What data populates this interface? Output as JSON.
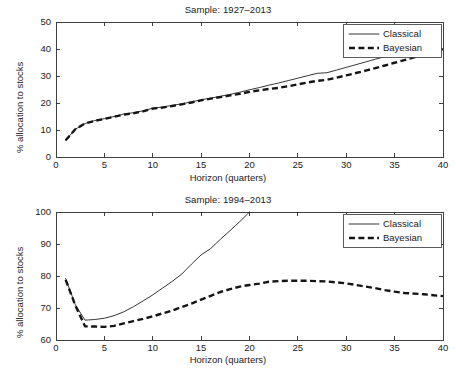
{
  "figure": {
    "width": 456,
    "height": 380,
    "background": "#ffffff",
    "line_color": "#1f1f1f"
  },
  "chart_data": [
    {
      "type": "line",
      "title": "Sample: 1927–2013",
      "xlabel": "Horizon (quarters)",
      "ylabel": "% allocation to stocks",
      "xlim": [
        0,
        40
      ],
      "ylim": [
        0,
        50
      ],
      "xticks": [
        0,
        5,
        10,
        15,
        20,
        25,
        30,
        35,
        40
      ],
      "yticks": [
        0,
        10,
        20,
        30,
        40,
        50
      ],
      "grid": false,
      "legend": [
        "Classical",
        "Bayesian"
      ],
      "legend_position": "upper right",
      "x": [
        1,
        2,
        3,
        4,
        5,
        6,
        7,
        8,
        9,
        10,
        11,
        12,
        13,
        14,
        15,
        16,
        17,
        18,
        19,
        20,
        21,
        22,
        23,
        24,
        25,
        26,
        27,
        28,
        29,
        30,
        31,
        32,
        33,
        34,
        35,
        36,
        37,
        38,
        39,
        40
      ],
      "series": [
        {
          "name": "Classical",
          "style": "solid",
          "values": [
            6.2,
            10.3,
            12.4,
            13.5,
            14.2,
            15.0,
            15.9,
            16.4,
            17.1,
            18.1,
            18.5,
            19.1,
            19.7,
            20.4,
            21.2,
            21.8,
            22.5,
            23.2,
            24.0,
            24.9,
            25.7,
            26.6,
            27.4,
            28.3,
            29.2,
            30.1,
            31.0,
            31.2,
            32.2,
            33.2,
            34.2,
            35.2,
            36.2,
            37.2,
            37.9,
            38.3,
            38.8,
            39.3,
            39.7,
            40.1
          ]
        },
        {
          "name": "Bayesian",
          "style": "dashed",
          "values": [
            6.2,
            10.3,
            12.4,
            13.4,
            14.1,
            14.9,
            15.7,
            16.2,
            16.9,
            17.9,
            18.3,
            18.9,
            19.5,
            20.2,
            21.0,
            21.6,
            22.2,
            22.8,
            23.4,
            24.1,
            24.7,
            25.2,
            25.6,
            26.2,
            26.9,
            27.6,
            28.2,
            28.6,
            29.4,
            30.2,
            31.1,
            32.0,
            32.9,
            33.9,
            34.9,
            35.9,
            36.9,
            37.9,
            38.9,
            39.9
          ]
        }
      ]
    },
    {
      "type": "line",
      "title": "Sample: 1994–2013",
      "xlabel": "Horizon (quarters)",
      "ylabel": "% allocation to stocks",
      "xlim": [
        0,
        40
      ],
      "ylim": [
        60,
        100
      ],
      "xticks": [
        0,
        5,
        10,
        15,
        20,
        25,
        30,
        35,
        40
      ],
      "yticks": [
        60,
        70,
        80,
        90,
        100
      ],
      "grid": false,
      "legend": [
        "Classical",
        "Bayesian"
      ],
      "legend_position": "upper right",
      "x": [
        1,
        2,
        3,
        4,
        5,
        6,
        7,
        8,
        9,
        10,
        11,
        12,
        13,
        14,
        15,
        16,
        17,
        18,
        19,
        20,
        21,
        22,
        23,
        24,
        25,
        26,
        27,
        28,
        29,
        30,
        31,
        32,
        33,
        34,
        35,
        36,
        37,
        38,
        39,
        40
      ],
      "series": [
        {
          "name": "Classical",
          "style": "solid",
          "values": [
            79.2,
            71.0,
            66.2,
            66.4,
            66.8,
            67.6,
            68.8,
            70.4,
            72.2,
            74.1,
            76.2,
            78.3,
            80.6,
            83.7,
            86.6,
            88.6,
            91.5,
            94.2,
            97.0,
            100.0,
            null,
            null,
            null,
            null,
            null,
            null,
            null,
            null,
            null,
            null,
            null,
            null,
            null,
            null,
            null,
            null,
            null,
            null,
            null,
            null
          ]
        },
        {
          "name": "Bayesian",
          "style": "dashed",
          "values": [
            78.8,
            70.8,
            64.3,
            64.2,
            64.1,
            64.4,
            65.2,
            65.9,
            66.6,
            67.4,
            68.3,
            69.2,
            70.3,
            71.4,
            72.6,
            73.8,
            75.0,
            75.9,
            76.7,
            77.2,
            77.6,
            78.2,
            78.4,
            78.5,
            78.5,
            78.5,
            78.4,
            78.3,
            78.0,
            77.7,
            77.2,
            76.7,
            76.2,
            75.6,
            75.1,
            74.7,
            74.5,
            74.3,
            74.0,
            73.7
          ]
        }
      ]
    }
  ]
}
